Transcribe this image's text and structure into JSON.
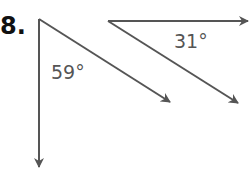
{
  "problem": {
    "number": "8."
  },
  "figure": {
    "stroke_color": "#555555",
    "angles": [
      {
        "label": "59°",
        "vertex": [
          39,
          19
        ],
        "rays": [
          {
            "to": [
              39,
              168
            ],
            "direction": "down"
          },
          {
            "to": [
              171,
              103
            ],
            "direction": "down-right"
          }
        ]
      },
      {
        "label": "31°",
        "vertex": [
          108,
          21
        ],
        "rays": [
          {
            "to": [
              249,
              21
            ],
            "direction": "right"
          },
          {
            "to": [
              239,
              104
            ],
            "direction": "down-right"
          }
        ]
      }
    ]
  }
}
